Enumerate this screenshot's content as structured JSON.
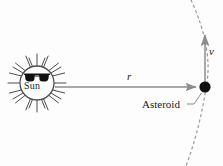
{
  "figure": {
    "type": "physics-diagram",
    "background_color": "#fdfdfd",
    "width": 223,
    "height": 166
  },
  "labels": {
    "sun": "Sun",
    "radius": "r",
    "velocity": "v",
    "asteroid": "Asteroid"
  },
  "colors": {
    "line": "#8c8c8c",
    "orbit": "#9a9a9a",
    "body": "#111111",
    "sun_outline": "#4d4d4d",
    "sun_fill": "#ffffff",
    "glasses": "#111111",
    "text": "#1a1a1a"
  },
  "geometry": {
    "sun_center": [
      37,
      83
    ],
    "sun_radius": 17,
    "sun_ray_count": 16,
    "sun_ray_length": 11,
    "asteroid_center": [
      205,
      87
    ],
    "asteroid_radius": 5.5,
    "radius_arrow": {
      "x1": 55,
      "y1": 87,
      "x2": 197,
      "y2": 87
    },
    "velocity_arrow": {
      "x1": 205,
      "y1": 84,
      "x2": 205,
      "y2": 33
    },
    "orbit_path": "M 191 0 Q 214 50 206 88 Q 200 128 186 166",
    "leader_line": {
      "x1": 186,
      "y1": 104,
      "x2": 200,
      "y2": 93
    }
  }
}
